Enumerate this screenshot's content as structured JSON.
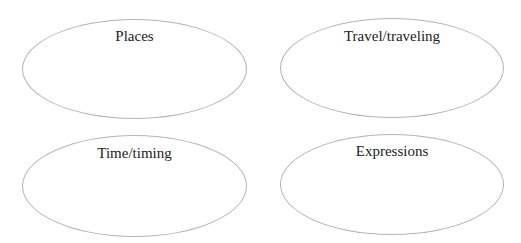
{
  "ovals": [
    {
      "label": "Places"
    },
    {
      "label": "Travel/traveling"
    },
    {
      "label": "Time/timing"
    },
    {
      "label": "Expressions"
    }
  ]
}
